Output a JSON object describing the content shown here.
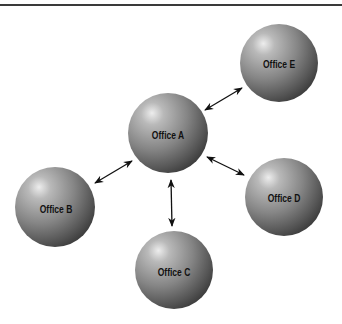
{
  "diagram": {
    "type": "hub-and-spoke network",
    "hub": "Office A",
    "nodes": [
      {
        "id": "A",
        "label": "Office A",
        "cx": 168,
        "cy": 133,
        "r": 40
      },
      {
        "id": "B",
        "label": "Office B",
        "cx": 55,
        "cy": 207,
        "r": 40
      },
      {
        "id": "C",
        "label": "Office C",
        "cx": 174,
        "cy": 270,
        "r": 39
      },
      {
        "id": "D",
        "label": "Office D",
        "cx": 284,
        "cy": 197,
        "r": 39
      },
      {
        "id": "E",
        "label": "Office E",
        "cx": 279,
        "cy": 63,
        "r": 39
      }
    ],
    "edges": [
      {
        "from": "A",
        "to": "E",
        "direction": "bidirectional"
      },
      {
        "from": "A",
        "to": "B",
        "direction": "bidirectional"
      },
      {
        "from": "A",
        "to": "D",
        "direction": "bidirectional"
      },
      {
        "from": "A",
        "to": "C",
        "direction": "bidirectional"
      }
    ],
    "colors": {
      "sphere_highlight": "#e8e8e8",
      "sphere_mid": "#8a8a8a",
      "sphere_shadow": "#3c3c3c",
      "arrow": "#111111",
      "rule": "#3a3a3a"
    }
  }
}
